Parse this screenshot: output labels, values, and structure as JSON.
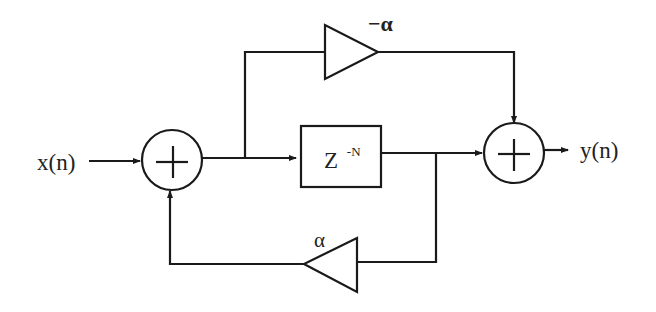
{
  "diagram": {
    "type": "block-diagram",
    "input_label": "x(n)",
    "output_label": "y(n)",
    "delay_block": {
      "base": "Z",
      "exponent": "-N"
    },
    "feedforward_gain": "−α",
    "feedback_gain": "α",
    "summers": [
      "+",
      "+"
    ],
    "colors": {
      "stroke": "#1a1a1a",
      "text": "#222222",
      "background": "#ffffff"
    }
  }
}
